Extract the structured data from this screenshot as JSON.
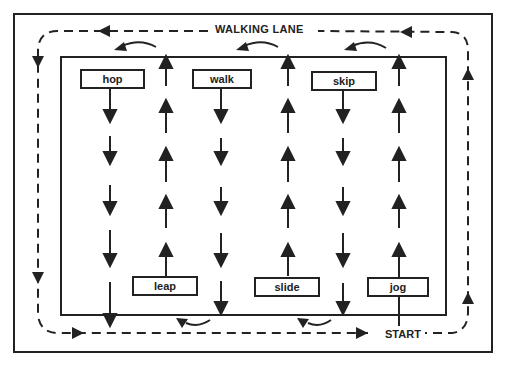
{
  "diagram": {
    "lane_label": "WALKING LANE",
    "start_label": "START",
    "stations": [
      {
        "label": "hop",
        "direction": "down",
        "position": "top"
      },
      {
        "label": "leap",
        "direction": "up",
        "position": "bottom"
      },
      {
        "label": "walk",
        "direction": "down",
        "position": "top"
      },
      {
        "label": "slide",
        "direction": "up",
        "position": "bottom"
      },
      {
        "label": "skip",
        "direction": "down",
        "position": "top"
      },
      {
        "label": "jog",
        "direction": "up",
        "position": "bottom"
      }
    ],
    "lane_direction": "counter-clockwise",
    "line_color": "#222222",
    "background_color": "#ffffff"
  }
}
